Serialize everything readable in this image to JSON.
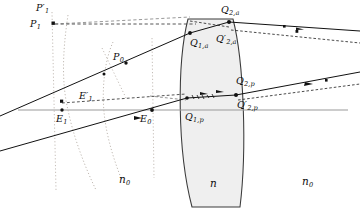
{
  "figure": {
    "type": "optical-ray-diagram",
    "background": "#ffffff",
    "ink_color": "#111111",
    "lens_fill": "#efefef",
    "lens_stroke": "#3a3a3a",
    "axis_color": "#909090",
    "dotted_color": "#b0a8a0"
  },
  "labels": {
    "p1_prime": {
      "base": "P",
      "sub": "1",
      "prime": true,
      "x": 36,
      "y": 5,
      "name": "label-p1-prime"
    },
    "p1": {
      "base": "P",
      "sub": "1",
      "prime": false,
      "x": 30,
      "y": 23,
      "name": "label-p1"
    },
    "p0": {
      "base": "P",
      "sub": "0",
      "prime": false,
      "x": 113,
      "y": 54,
      "name": "label-p0"
    },
    "e1_prime": {
      "base": "E",
      "sub": "1",
      "prime": true,
      "x": 80,
      "y": 95,
      "name": "label-e1-prime"
    },
    "e1": {
      "base": "E",
      "sub": "1",
      "prime": false,
      "x": 58,
      "y": 118,
      "name": "label-e1"
    },
    "e0": {
      "base": "E",
      "sub": "0",
      "prime": false,
      "x": 141,
      "y": 118,
      "name": "label-e0"
    },
    "q1a": {
      "base": "Q",
      "sub": "1,a",
      "prime": false,
      "x": 190,
      "y": 42,
      "name": "label-q1a"
    },
    "q2a": {
      "base": "Q",
      "sub": "2,a",
      "prime": false,
      "x": 222,
      "y": 9,
      "name": "label-q2a"
    },
    "q2a_prime": {
      "base": "Q",
      "sub": "2,a",
      "prime": true,
      "x": 218,
      "y": 38,
      "name": "label-q2a-prime"
    },
    "q1p": {
      "base": "Q",
      "sub": "1,p",
      "prime": false,
      "x": 186,
      "y": 116,
      "name": "label-q1p"
    },
    "q2p": {
      "base": "Q",
      "sub": "2,p",
      "prime": false,
      "x": 236,
      "y": 80,
      "name": "label-q2p"
    },
    "q2p_prime": {
      "base": "Q",
      "sub": "2,p",
      "prime": true,
      "x": 238,
      "y": 104,
      "name": "label-q2p-prime"
    },
    "n_lens": {
      "base": "n",
      "sub": "",
      "prime": false,
      "x": 211,
      "y": 182,
      "name": "label-n-lens"
    },
    "n0_left": {
      "base": "n",
      "sub": "0",
      "prime": false,
      "x": 120,
      "y": 178,
      "name": "label-n0-left"
    },
    "n0_right": {
      "base": "n",
      "sub": "0",
      "prime": false,
      "x": 303,
      "y": 180,
      "name": "label-n0-right"
    }
  },
  "geometry": {
    "axis": {
      "y": 110,
      "x1": 18,
      "x2": 348
    },
    "lens": {
      "top_y": 19,
      "bottom_y": 207,
      "top_left_x": 188,
      "top_right_x": 233,
      "bottom_left_x": 192,
      "bottom_right_x": 240,
      "left_bulge_x": 178,
      "right_bulge_x": 246
    },
    "solid_rays": [
      {
        "name": "ray-upper-incident",
        "x1": 0,
        "y1": 115,
        "x2": 188,
        "y2": 36
      },
      {
        "name": "ray-lower-incident",
        "x1": 0,
        "y1": 150,
        "x2": 186,
        "y2": 98
      },
      {
        "name": "ray-upper-exit",
        "x1": 231,
        "y1": 23,
        "x2": 360,
        "y2": 32
      },
      {
        "name": "ray-lower-exit",
        "x1": 238,
        "y1": 96,
        "x2": 360,
        "y2": 74
      }
    ],
    "dotted_arcs": 2,
    "points": 9
  }
}
